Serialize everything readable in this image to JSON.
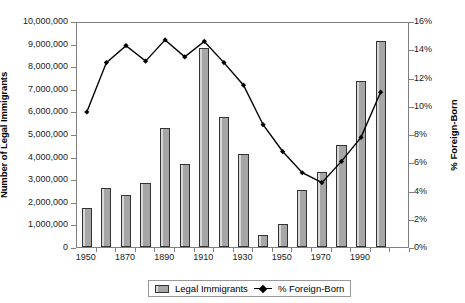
{
  "chart_data": {
    "type": "bar",
    "title": "",
    "subtitle": "",
    "xlabel": "",
    "ylabel": "Number of Legal Immigrants",
    "y2label": "% Foreign-Born",
    "grid": false,
    "legend_position": "bottom",
    "ylim": [
      0,
      10000000
    ],
    "y2lim": [
      0,
      0.16
    ],
    "ytick_labels": [
      "10,000,000",
      "9,000,000",
      "8,000,000",
      "7,000,000",
      "6,000,000",
      "5,000,000",
      "4,000,000",
      "3,000,000",
      "2,000,000",
      "1,000,000",
      "0"
    ],
    "ytick_values": [
      10000000,
      9000000,
      8000000,
      7000000,
      6000000,
      5000000,
      4000000,
      3000000,
      2000000,
      1000000,
      0
    ],
    "y2tick_labels": [
      "16%",
      "14%",
      "12%",
      "10%",
      "8%",
      "6%",
      "4%",
      "2%",
      "0%"
    ],
    "y2tick_values": [
      16,
      14,
      12,
      10,
      8,
      6,
      4,
      2,
      0
    ],
    "categories": [
      "1850",
      "1860",
      "1870",
      "1880",
      "1890",
      "1900",
      "1910",
      "1920",
      "1930",
      "1940",
      "1950",
      "1960",
      "1970",
      "1980",
      "1990",
      "2000",
      "2010"
    ],
    "xtick_labels": [
      "1950",
      "1870",
      "1890",
      "1910",
      "1930",
      "1950",
      "1970",
      "1990"
    ],
    "xtick_categories": [
      "1850",
      "1870",
      "1890",
      "1910",
      "1930",
      "1950",
      "1970",
      "1990"
    ],
    "series": [
      {
        "name": "Legal Immigrants",
        "type": "bar",
        "axis": "left",
        "color": "#a6a6a6",
        "values": [
          1713000,
          2598000,
          2315000,
          2812000,
          5247000,
          3688000,
          8795000,
          5736000,
          4107000,
          528000,
          1035000,
          2515000,
          3322000,
          4493000,
          7338000,
          9095000,
          1000
        ]
      },
      {
        "name": "% Foreign-Born",
        "type": "line",
        "axis": "right",
        "color": "#000000",
        "marker": "diamond",
        "values": [
          9.7,
          13.2,
          14.4,
          13.3,
          14.8,
          13.6,
          14.7,
          13.2,
          11.6,
          8.8,
          6.9,
          5.4,
          4.7,
          6.2,
          7.9,
          11.1,
          null
        ]
      }
    ]
  },
  "axes": {
    "left_title": "Number of Legal Immigrants",
    "right_title": "% Foreign-Born"
  },
  "legend": {
    "items": [
      {
        "label": "Legal Immigrants",
        "marker": "bar-swatch"
      },
      {
        "label": "% Foreign-Born",
        "marker": "line-diamond"
      }
    ]
  }
}
